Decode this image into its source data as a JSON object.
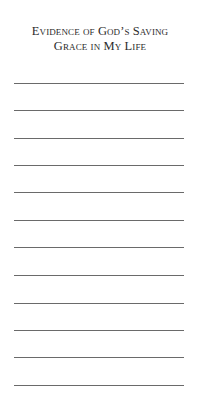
{
  "header": {
    "title_line_1": "Evidence of God’s Saving",
    "title_line_2": "Grace in My Life"
  },
  "writing_lines": {
    "count": 12,
    "positions_y": [
      83,
      110,
      138,
      165,
      192,
      220,
      247,
      275,
      303,
      330,
      357,
      385
    ]
  }
}
